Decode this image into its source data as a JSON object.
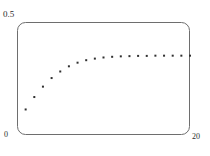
{
  "chart_data": {
    "type": "scatter",
    "title": "",
    "subtitle": "",
    "xlabel": "",
    "ylabel": "",
    "xlim": [
      0,
      20
    ],
    "ylim": [
      0,
      0.5
    ],
    "grid": false,
    "legend": null,
    "marker": {
      "shape": "square",
      "size_px": 2,
      "color": "#303030"
    },
    "axis_ticks": {
      "x": [
        {
          "value": 0,
          "label": "0",
          "position": "bottom-left"
        },
        {
          "value": 20,
          "label": "20",
          "position": "bottom-right"
        }
      ],
      "y": [
        {
          "value": 0.5,
          "label": "0.5",
          "position": "top-left"
        }
      ]
    },
    "series": [
      {
        "name": "series-1",
        "x": [
          1,
          2,
          3,
          4,
          5,
          6,
          7,
          8,
          9,
          10,
          11,
          12,
          13,
          14,
          15,
          16,
          17,
          18,
          19,
          20
        ],
        "values": [
          0.113,
          0.168,
          0.214,
          0.252,
          0.281,
          0.304,
          0.32,
          0.331,
          0.338,
          0.343,
          0.346,
          0.348,
          0.349,
          0.35,
          0.35,
          0.351,
          0.351,
          0.351,
          0.351,
          0.351
        ]
      }
    ]
  },
  "labels": {
    "y_max": "0.5",
    "origin": "0",
    "x_max": "20"
  },
  "frame": {
    "stroke_color": "#6e6e6e",
    "corner_radius": 8,
    "left": 17,
    "top": 22,
    "right": 190,
    "bottom": 135
  }
}
